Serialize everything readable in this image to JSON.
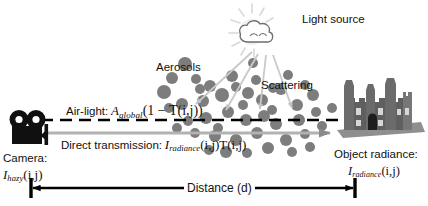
{
  "diagram": {
    "background_color": "#ffffff",
    "particle_color": "#7d7d7d",
    "arrow_color": "#000000",
    "transmission_line_color": "#b0b0b0",
    "ray_color": "#c9c9c9"
  },
  "labels": {
    "light_source": "Light source",
    "aerosols": "Aerosols",
    "scattering": "Scattering",
    "camera": "Camera:",
    "object_radiance": "Object radiance:",
    "distance": "Distance (d)"
  },
  "formulas": {
    "airlight_prefix": "Air-light:",
    "airlight_symbol": "A",
    "airlight_subscript": "global",
    "airlight_body": "(1 − T(i,j))",
    "direct_prefix": "Direct transmission:",
    "direct_symbol": "I",
    "direct_subscript": "radiance",
    "direct_body": "(i,j)T(i,j)",
    "ihazy_symbol": "I",
    "ihazy_subscript": "hazy",
    "ihazy_body": "(i,j)",
    "iradiance_symbol": "I",
    "iradiance_subscript": "radiance",
    "iradiance_body": "(i,j)"
  },
  "icons": {
    "camera": "video-camera-icon",
    "light_source": "sun-behind-cloud-icon",
    "object": "castle-building-icon"
  },
  "particles": [
    [
      185,
      64,
      7
    ],
    [
      172,
      78,
      6
    ],
    [
      196,
      79,
      5
    ],
    [
      164,
      92,
      7
    ],
    [
      210,
      86,
      6
    ],
    [
      232,
      76,
      6
    ],
    [
      248,
      93,
      6
    ],
    [
      222,
      95,
      7
    ],
    [
      203,
      101,
      6
    ],
    [
      182,
      104,
      6
    ],
    [
      243,
      105,
      5
    ],
    [
      262,
      100,
      6
    ],
    [
      281,
      89,
      6
    ],
    [
      297,
      105,
      6
    ],
    [
      313,
      95,
      6
    ],
    [
      264,
      116,
      6
    ],
    [
      246,
      120,
      6
    ],
    [
      228,
      112,
      6
    ],
    [
      206,
      118,
      6
    ],
    [
      188,
      121,
      5
    ],
    [
      276,
      124,
      6
    ],
    [
      299,
      120,
      6
    ],
    [
      316,
      112,
      5
    ],
    [
      257,
      133,
      6
    ],
    [
      236,
      140,
      6
    ],
    [
      215,
      136,
      6
    ],
    [
      286,
      140,
      6
    ],
    [
      305,
      134,
      5
    ],
    [
      268,
      148,
      6
    ],
    [
      247,
      153,
      5
    ],
    [
      226,
      152,
      6
    ],
    [
      292,
      152,
      5
    ],
    [
      195,
      133,
      5
    ],
    [
      177,
      128,
      5
    ],
    [
      209,
      150,
      5
    ],
    [
      322,
      126,
      5
    ],
    [
      332,
      108,
      5
    ],
    [
      200,
      89,
      5
    ],
    [
      236,
      87,
      5
    ],
    [
      256,
      80,
      5
    ],
    [
      272,
      110,
      5
    ],
    [
      218,
      128,
      5
    ],
    [
      253,
      63,
      5
    ],
    [
      288,
      75,
      5
    ],
    [
      305,
      85,
      5
    ],
    [
      169,
      108,
      5
    ],
    [
      310,
      147,
      5
    ],
    [
      273,
      88,
      5
    ]
  ],
  "light_rays": [
    {
      "x1": 252,
      "y1": 52,
      "x2": 196,
      "y2": 104
    },
    {
      "x1": 258,
      "y1": 54,
      "x2": 226,
      "y2": 110
    },
    {
      "x1": 266,
      "y1": 55,
      "x2": 260,
      "y2": 109
    },
    {
      "x1": 273,
      "y1": 55,
      "x2": 292,
      "y2": 108
    }
  ]
}
